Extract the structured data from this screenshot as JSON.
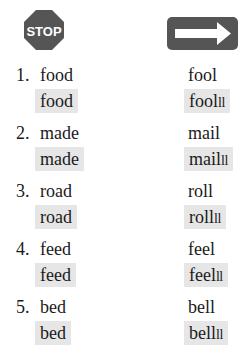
{
  "header": {
    "left_icon": "stop-sign-icon",
    "left_icon_text": "STOP",
    "right_icon": "arrow-right-sign-icon",
    "icon_color": "#555555",
    "highlight_color": "#e6e6e6"
  },
  "rows": [
    {
      "number": "1.",
      "stop_word": "food",
      "stop_word_highlight": "food",
      "cont_word": "fool",
      "cont_word_highlight": "fool",
      "cont_tail": "ll"
    },
    {
      "number": "2.",
      "stop_word": "made",
      "stop_word_highlight": "made",
      "cont_word": "mail",
      "cont_word_highlight": "mail",
      "cont_tail": "ll"
    },
    {
      "number": "3.",
      "stop_word": "road",
      "stop_word_highlight": "road",
      "cont_word": "roll",
      "cont_word_highlight": "roll",
      "cont_tail": "ll"
    },
    {
      "number": "4.",
      "stop_word": "feed",
      "stop_word_highlight": "feed",
      "cont_word": "feel",
      "cont_word_highlight": "feel",
      "cont_tail": "ll"
    },
    {
      "number": "5.",
      "stop_word": "bed",
      "stop_word_highlight": "bed",
      "cont_word": "bell",
      "cont_word_highlight": "bell",
      "cont_tail": "ll"
    }
  ]
}
